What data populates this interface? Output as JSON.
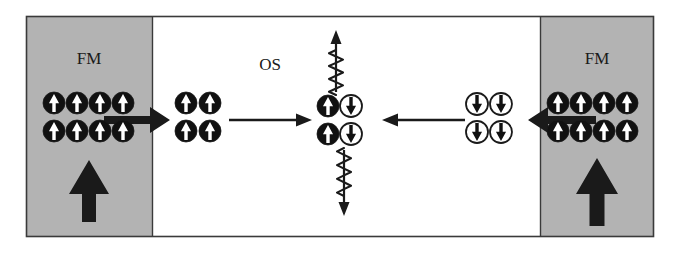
{
  "figure": {
    "title": "",
    "frame": {
      "x": 26,
      "y": 16,
      "width": 628,
      "height": 221,
      "border_color": "#3a3a3a",
      "background": "#ffffff"
    },
    "colors": {
      "fm_fill": "#b3b3b3",
      "os_fill": "#ffffff",
      "ink": "#1a1a1a",
      "spin_up_circle_fill": "#111111",
      "spin_up_arrow_fill": "#ffffff",
      "spin_down_circle_fill": "#ffffff",
      "spin_down_arrow_fill": "#111111",
      "border": "#3a3a3a"
    }
  },
  "regions": [
    {
      "id": "fm-left",
      "label": "FM",
      "x": 26,
      "y": 16,
      "width": 126,
      "height": 221,
      "fill": "#b3b3b3",
      "label_x": 89,
      "label_y": 64
    },
    {
      "id": "os",
      "label": "OS",
      "x": 152,
      "y": 16,
      "width": 388,
      "height": 221,
      "fill": "#ffffff",
      "label_x": 270,
      "label_y": 70
    },
    {
      "id": "fm-right",
      "label": "FM",
      "x": 540,
      "y": 16,
      "width": 114,
      "height": 221,
      "fill": "#b3b3b3",
      "label_x": 597,
      "label_y": 64
    }
  ],
  "spin_groups": [
    {
      "id": "fm-left-spins",
      "region": "fm-left",
      "spin": "up",
      "style": "filled",
      "columns": 4,
      "rows": 2,
      "origin_x": 54,
      "origin_y": 103,
      "step_x": 23,
      "step_y": 28,
      "radius": 11
    },
    {
      "id": "os-left-injected-spins",
      "region": "os",
      "spin": "up",
      "style": "filled",
      "columns": 2,
      "rows": 2,
      "origin_x": 186,
      "origin_y": 103,
      "step_x": 24,
      "step_y": 28,
      "radius": 11
    },
    {
      "id": "os-center-up-spins",
      "region": "os",
      "spin": "up",
      "style": "filled",
      "columns": 1,
      "rows": 2,
      "origin_x": 328,
      "origin_y": 106,
      "step_x": 0,
      "step_y": 28,
      "radius": 11
    },
    {
      "id": "os-center-down-spins",
      "region": "os",
      "spin": "down",
      "style": "open",
      "columns": 1,
      "rows": 2,
      "origin_x": 351,
      "origin_y": 106,
      "step_x": 0,
      "step_y": 28,
      "radius": 11
    },
    {
      "id": "os-right-injected-spins",
      "region": "os",
      "spin": "down",
      "style": "open",
      "columns": 2,
      "rows": 2,
      "origin_x": 477,
      "origin_y": 104,
      "step_x": 24,
      "step_y": 28,
      "radius": 11
    },
    {
      "id": "fm-right-spins",
      "region": "fm-right",
      "spin": "up",
      "style": "filled",
      "columns": 4,
      "rows": 2,
      "origin_x": 558,
      "origin_y": 103,
      "step_x": 23,
      "step_y": 28,
      "radius": 11
    }
  ],
  "arrows": {
    "magnetization": [
      {
        "id": "fm-left-magnetization",
        "direction": "up",
        "x": 89,
        "tail_y": 222,
        "head_y": 160,
        "shaft_width": 14,
        "head_width": 40,
        "head_length": 34
      },
      {
        "id": "fm-right-magnetization",
        "direction": "up",
        "x": 597,
        "tail_y": 226,
        "head_y": 158,
        "shaft_width": 15,
        "head_width": 42,
        "head_length": 36
      }
    ],
    "injection": [
      {
        "id": "left-injection-arrow",
        "direction": "right",
        "x1": 104,
        "x2": 170,
        "y": 120,
        "shaft_width": 8,
        "head_width": 26,
        "head_length": 20
      },
      {
        "id": "right-injection-arrow",
        "direction": "left",
        "x1": 596,
        "x2": 528,
        "y": 120,
        "shaft_width": 8,
        "head_width": 26,
        "head_length": 20
      }
    ],
    "transport": [
      {
        "id": "left-transport-arrow",
        "direction": "right",
        "x1": 229,
        "x2": 312,
        "y": 120,
        "shaft_width": 2.4,
        "head_width": 13,
        "head_length": 16
      },
      {
        "id": "right-transport-arrow",
        "direction": "left",
        "x1": 465,
        "x2": 382,
        "y": 120,
        "shaft_width": 2.4,
        "head_width": 13,
        "head_length": 16
      }
    ],
    "relaxation": [
      {
        "id": "spin-relaxation-arrow-up",
        "direction": "up",
        "x": 336,
        "tail_y": 92,
        "head_y": 30,
        "shaft_width": 2.2,
        "head_width": 11,
        "head_length": 14
      },
      {
        "id": "spin-relaxation-arrow-down",
        "direction": "down",
        "x": 344,
        "tail_y": 150,
        "head_y": 216,
        "shaft_width": 2.2,
        "head_width": 11,
        "head_length": 14
      }
    ]
  },
  "squiggles": [
    {
      "id": "squiggle-top",
      "x": 336,
      "y_start": 50,
      "y_end": 95,
      "amplitude": 7,
      "cycles": 3.5
    },
    {
      "id": "squiggle-bottom",
      "x": 344,
      "y_start": 148,
      "y_end": 196,
      "amplitude": 7,
      "cycles": 3.5
    }
  ],
  "labels": {
    "fm_left": "FM",
    "fm_right": "FM",
    "os": "OS",
    "font_size": 17
  }
}
